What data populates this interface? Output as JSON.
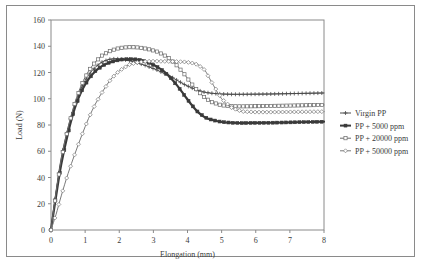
{
  "chart_data": {
    "type": "line",
    "title": "",
    "xlabel": "Elongation (mm)",
    "ylabel": "Load (N)",
    "xlim": [
      0,
      8
    ],
    "ylim": [
      0,
      160
    ],
    "xticks": [
      "0",
      "1",
      "2",
      "3",
      "4",
      "5",
      "6",
      "7",
      "8"
    ],
    "yticks": [
      "0",
      "20",
      "40",
      "60",
      "80",
      "100",
      "120",
      "140",
      "160"
    ],
    "grid": false,
    "legend_position": "right",
    "series": [
      {
        "name": "Virgin PP",
        "marker": "plus-dot",
        "color": "#4a4a4a",
        "x": [
          0,
          0.05,
          0.15,
          0.3,
          0.5,
          0.7,
          0.9,
          1.1,
          1.3,
          1.5,
          1.7,
          1.9,
          2.1,
          2.3,
          2.5,
          2.7,
          2.9,
          3.1,
          3.3,
          3.5,
          3.7,
          3.9,
          4.1,
          4.3,
          4.5,
          4.7,
          5.0,
          5.3,
          5.6,
          6.0,
          6.4,
          6.8,
          7.2,
          7.6,
          8.0
        ],
        "y": [
          0,
          11,
          30,
          55,
          78,
          96,
          109,
          118,
          124,
          128,
          130,
          130.5,
          130,
          129,
          127.5,
          126,
          124,
          122,
          119.5,
          117,
          114,
          111,
          108.5,
          106.5,
          105,
          104.2,
          103.6,
          103.4,
          103.4,
          103.5,
          103.6,
          103.8,
          104,
          104.2,
          104.4
        ]
      },
      {
        "name": "PP + 5000 ppm",
        "marker": "square",
        "color": "#3a3a3a",
        "x": [
          0,
          0.05,
          0.15,
          0.3,
          0.5,
          0.7,
          0.9,
          1.1,
          1.3,
          1.5,
          1.7,
          1.9,
          2.1,
          2.3,
          2.5,
          2.7,
          2.9,
          3.1,
          3.3,
          3.5,
          3.7,
          3.9,
          4.1,
          4.3,
          4.5,
          4.7,
          5.0,
          5.3,
          5.6,
          6.0,
          6.4,
          6.8,
          7.2,
          7.6,
          8.0
        ],
        "y": [
          0,
          9,
          26,
          50,
          74,
          93,
          106,
          115,
          121,
          125,
          127.5,
          129,
          130,
          130.2,
          130,
          129,
          127,
          124.5,
          121,
          116,
          110,
          103,
          96,
          90,
          86,
          84,
          82.3,
          81.7,
          81.5,
          81.6,
          81.7,
          81.9,
          82.1,
          82.3,
          82.5
        ]
      },
      {
        "name": "PP + 20000 ppm",
        "marker": "open-square",
        "color": "#6a6a6a",
        "x": [
          0,
          0.05,
          0.15,
          0.3,
          0.5,
          0.7,
          0.9,
          1.1,
          1.3,
          1.5,
          1.7,
          1.9,
          2.1,
          2.3,
          2.5,
          2.7,
          2.9,
          3.1,
          3.3,
          3.5,
          3.7,
          3.9,
          4.1,
          4.3,
          4.5,
          4.7,
          5.0,
          5.3,
          5.6,
          6.0,
          6.4,
          6.8,
          7.2,
          7.6,
          8.0
        ],
        "y": [
          0,
          10,
          29,
          54,
          78,
          97,
          111,
          121,
          128,
          133,
          136,
          138,
          139,
          139.3,
          139.2,
          138.6,
          137.5,
          136,
          133.5,
          130,
          125,
          119,
          112,
          106,
          101,
          97.5,
          95,
          94.3,
          94.2,
          94.3,
          94.5,
          94.7,
          94.9,
          95.1,
          95.3
        ]
      },
      {
        "name": "PP + 50000 ppm",
        "marker": "diamond",
        "color": "#7a7a7a",
        "x": [
          0,
          0.05,
          0.15,
          0.3,
          0.5,
          0.7,
          0.9,
          1.1,
          1.3,
          1.5,
          1.7,
          1.9,
          2.1,
          2.3,
          2.5,
          2.7,
          2.9,
          3.1,
          3.3,
          3.5,
          3.7,
          3.9,
          4.1,
          4.3,
          4.5,
          4.7,
          5.0,
          5.3,
          5.6,
          6.0,
          6.4,
          6.8,
          7.2,
          7.6,
          8.0
        ],
        "y": [
          0,
          4,
          12,
          26,
          43,
          58,
          72,
          85,
          96,
          105,
          113,
          119,
          123,
          126,
          127.5,
          128.3,
          128.6,
          128.6,
          128.5,
          128.4,
          128.3,
          128.1,
          127.5,
          126,
          122,
          113,
          100,
          93,
          90.3,
          89.8,
          89.8,
          89.9,
          90,
          90.1,
          90.2
        ]
      }
    ]
  },
  "legend": {
    "entries": [
      {
        "label": "Virgin PP"
      },
      {
        "label": "PP + 5000 ppm"
      },
      {
        "label": "PP + 20000 ppm"
      },
      {
        "label": "PP + 50000 ppm"
      }
    ]
  },
  "colors": {
    "frame": "#8a8a8a",
    "axis": "#8a8a8a",
    "text": "#3a3a3a",
    "background": "#ffffff"
  }
}
